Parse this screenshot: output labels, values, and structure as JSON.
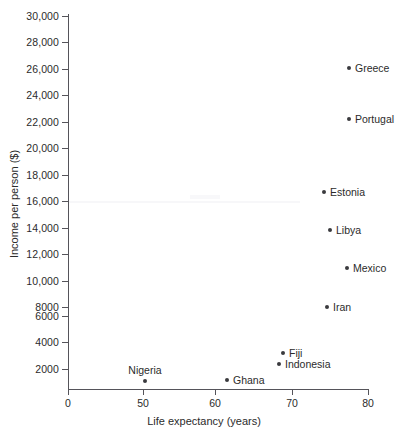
{
  "chart_data": {
    "type": "scatter",
    "title": "",
    "xlabel": "Life expectancy (years)",
    "ylabel": "Income per person ($)",
    "xlim": [
      0,
      80
    ],
    "ylim": [
      0,
      30000
    ],
    "x_axis_break": true,
    "grid": false,
    "legend": "none",
    "xticks": [
      {
        "value": 0,
        "label": "0",
        "px": 68
      },
      {
        "value": 50,
        "label": "50",
        "px": 143
      },
      {
        "value": 60,
        "label": "60",
        "px": 215
      },
      {
        "value": 70,
        "label": "70",
        "px": 292
      },
      {
        "value": 80,
        "label": "80",
        "px": 368
      }
    ],
    "yticks": [
      {
        "value": 30000,
        "label": "30,000",
        "px": 16
      },
      {
        "value": 28000,
        "label": "28,000",
        "px": 42
      },
      {
        "value": 26000,
        "label": "26,000",
        "px": 69
      },
      {
        "value": 24000,
        "label": "24,000",
        "px": 95
      },
      {
        "value": 22000,
        "label": "22,000",
        "px": 122
      },
      {
        "value": 20000,
        "label": "20,000",
        "px": 148
      },
      {
        "value": 18000,
        "label": "18,000",
        "px": 175
      },
      {
        "value": 16000,
        "label": "16,000",
        "px": 201
      },
      {
        "value": 14000,
        "label": "14,000",
        "px": 228
      },
      {
        "value": 12000,
        "label": "12,000",
        "px": 254
      },
      {
        "value": 10000,
        "label": "10,000",
        "px": 281
      },
      {
        "value": 8000,
        "label": "8000",
        "px": 307
      },
      {
        "value": 6000,
        "label": "6000",
        "px": 316
      },
      {
        "value": 4000,
        "label": "4000",
        "px": 342
      },
      {
        "value": 2000,
        "label": "2000",
        "px": 369
      }
    ],
    "points": [
      {
        "name": "Greece",
        "x": 78.5,
        "y": 25800,
        "px": 349,
        "py": 68,
        "label_pos": "right"
      },
      {
        "name": "Portugal",
        "x": 78.5,
        "y": 21800,
        "px": 349,
        "py": 119,
        "label_pos": "right"
      },
      {
        "name": "Estonia",
        "x": 74.5,
        "y": 15700,
        "px": 324,
        "py": 192,
        "label_pos": "right"
      },
      {
        "name": "Libya",
        "x": 75.0,
        "y": 12900,
        "px": 330,
        "py": 230,
        "label_pos": "right"
      },
      {
        "name": "Mexico",
        "x": 78.0,
        "y": 9900,
        "px": 347,
        "py": 268,
        "label_pos": "right"
      },
      {
        "name": "Iran",
        "x": 74.5,
        "y": 6600,
        "px": 327,
        "py": 307,
        "label_pos": "right"
      },
      {
        "name": "Fiji",
        "x": 69.0,
        "y": 3200,
        "px": 283,
        "py": 353,
        "label_pos": "right"
      },
      {
        "name": "Indonesia",
        "x": 68.5,
        "y": 2400,
        "px": 279,
        "py": 364,
        "label_pos": "right"
      },
      {
        "name": "Ghana",
        "x": 61.5,
        "y": 1300,
        "px": 227,
        "py": 380,
        "label_pos": "right"
      },
      {
        "name": "Nigeria",
        "x": 50.0,
        "y": 1200,
        "px": 145,
        "py": 381,
        "label_pos": "above"
      }
    ]
  },
  "colors": {
    "point": "#3a3a3e",
    "axis": "#55545a",
    "text": "#2b2b2b",
    "background": "#ffffff"
  }
}
